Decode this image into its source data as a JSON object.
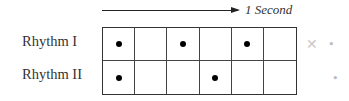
{
  "timeline": {
    "label": "1 Second",
    "arrow_icon": "arrow-right-icon"
  },
  "rhythms": [
    {
      "label": "Rhythm I",
      "beats": [
        1,
        0,
        1,
        0,
        1,
        0
      ]
    },
    {
      "label": "Rhythm II",
      "beats": [
        1,
        0,
        0,
        1,
        0,
        0
      ]
    }
  ],
  "grid": {
    "columns": 6,
    "rows": 2
  },
  "artifacts": {
    "mark1": "✕",
    "mark2": "•",
    "mark3": "•"
  }
}
